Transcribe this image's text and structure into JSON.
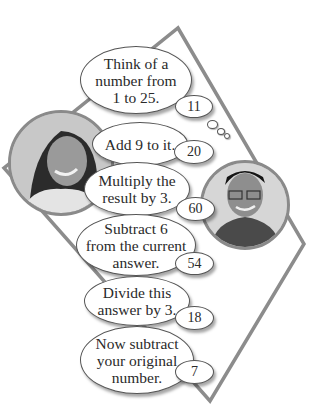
{
  "steps": [
    {
      "instruction_lines": [
        "Think of a",
        "number from",
        "1 to 25."
      ],
      "answer": "11"
    },
    {
      "instruction_lines": [
        "Add 9 to it."
      ],
      "answer": "20"
    },
    {
      "instruction_lines": [
        "Multiply the",
        "result by 3."
      ],
      "answer": "60"
    },
    {
      "instruction_lines": [
        "Subtract 6",
        "from the current",
        "answer."
      ],
      "answer": "54"
    },
    {
      "instruction_lines": [
        "Divide this",
        "answer by 3."
      ],
      "answer": "18"
    },
    {
      "instruction_lines": [
        "Now subtract",
        "your original",
        "number."
      ],
      "answer": "7"
    }
  ],
  "colors": {
    "frame": "#8c8c8c",
    "bubble_border": "#555555",
    "background": "#ffffff"
  },
  "portraits": [
    {
      "label": "girl-portrait"
    },
    {
      "label": "boy-portrait"
    }
  ]
}
